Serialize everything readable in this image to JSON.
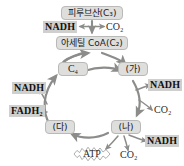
{
  "diagram": {
    "colors": {
      "node_fill": "#dededd",
      "node_border": "#b9b9b7",
      "chem_highlight": "#cfcfcd",
      "arrow": "#8c8c8a",
      "text": "#1a1a1a",
      "background": "#ffffff"
    },
    "nodes": {
      "pyruvate": "피루브산(C₃)",
      "acetyl_coa": "아세틸 CoA(C₂)",
      "c4": "C₄",
      "ga": "(가)",
      "na": "(나)",
      "da": "(다)"
    },
    "labels": {
      "nadh_top": "NADH",
      "co2_top": "CO₂",
      "nadh_left_upper": "NADH",
      "fadh2": "FADH₂",
      "nadh_right_upper": "NADH",
      "co2_right": "CO₂",
      "nadh_bottom_right": "NADH",
      "co2_bottom": "CO₂",
      "atp": "ATP"
    }
  }
}
